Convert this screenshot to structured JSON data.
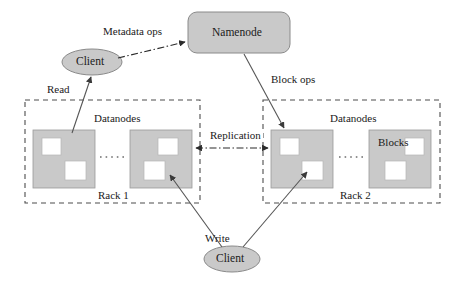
{
  "diagram": {
    "type": "hdfs-architecture-diagram",
    "background_color": "#ffffff",
    "fill_gray": "#c9c9c9",
    "block_fill": "#ffffff",
    "stroke_color": "#6e6e6e",
    "text_color": "#1a1a1a"
  },
  "nodes": {
    "namenode": {
      "label": "Namenode",
      "shape": "rounded-rect",
      "x": 188,
      "y": 12,
      "w": 102,
      "h": 41
    },
    "client_top": {
      "label": "Client",
      "shape": "ellipse",
      "cx": 92,
      "cy": 62,
      "rx": 30,
      "ry": 13
    },
    "client_bottom": {
      "label": "Client",
      "shape": "ellipse",
      "cx": 232,
      "cy": 259,
      "rx": 28,
      "ry": 13
    }
  },
  "racks": [
    {
      "name": "Rack 1",
      "label": "Rack 1",
      "datanodes_label": "Datanodes",
      "x": 25,
      "y": 100,
      "w": 175,
      "h": 103,
      "datanodes": [
        {
          "x": 33,
          "y": 130,
          "w": 62,
          "h": 58,
          "blocks": [
            {
              "x": 9,
              "y": 8,
              "w": 19,
              "h": 17
            },
            {
              "x": 32,
              "y": 31,
              "w": 21,
              "h": 19
            }
          ]
        },
        {
          "x": 130,
          "y": 130,
          "w": 62,
          "h": 58,
          "blocks": [
            {
              "x": 28,
              "y": 8,
              "w": 20,
              "h": 17
            },
            {
              "x": 14,
              "y": 31,
              "w": 21,
              "h": 19
            }
          ]
        }
      ]
    },
    {
      "name": "Rack 2",
      "label": "Rack 2",
      "datanodes_label": "Datanodes",
      "blocks_label": "Blocks",
      "x": 263,
      "y": 100,
      "w": 177,
      "h": 103,
      "datanodes": [
        {
          "x": 271,
          "y": 130,
          "w": 62,
          "h": 58,
          "blocks": [
            {
              "x": 9,
              "y": 8,
              "w": 19,
              "h": 17
            },
            {
              "x": 31,
              "y": 31,
              "w": 21,
              "h": 19
            }
          ]
        },
        {
          "x": 369,
          "y": 130,
          "w": 62,
          "h": 58,
          "blocks": [
            {
              "x": 36,
              "y": 8,
              "w": 19,
              "h": 17
            },
            {
              "x": 16,
              "y": 31,
              "w": 21,
              "h": 19
            }
          ]
        }
      ]
    }
  ],
  "edge_labels": {
    "metadata_ops": "Metadata ops",
    "block_ops": "Block ops",
    "read": "Read",
    "write": "Write",
    "replication": "Replication"
  },
  "label_positions": {
    "metadata_ops": {
      "x": 103,
      "y": 26
    },
    "block_ops": {
      "x": 271,
      "y": 74
    },
    "read": {
      "x": 47,
      "y": 84
    },
    "write": {
      "x": 205,
      "y": 233
    },
    "replication": {
      "x": 208,
      "y": 130
    },
    "datanodes_left": {
      "x": 94,
      "y": 113
    },
    "datanodes_right": {
      "x": 330,
      "y": 113
    },
    "blocks": {
      "x": 378,
      "y": 137
    },
    "rack1": {
      "x": 98,
      "y": 190
    },
    "rack2": {
      "x": 340,
      "y": 190
    },
    "namenode_text": {
      "x": 212,
      "y": 27
    },
    "client_top_text": {
      "x": 76,
      "y": 56
    },
    "client_bottom_text": {
      "x": 216,
      "y": 253
    }
  }
}
